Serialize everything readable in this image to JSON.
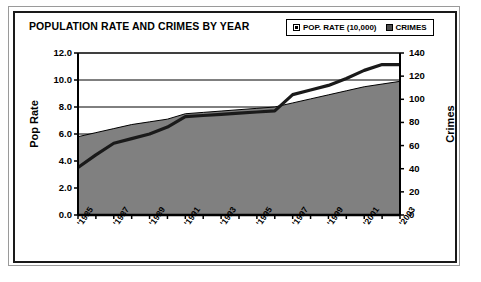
{
  "chart": {
    "title": "POPULATION RATE AND CRIMES BY YEAR",
    "legend": {
      "items": [
        {
          "label": "POP. RATE (10,000)",
          "swatch": "pop-rate-swatch",
          "color": "#ffffff"
        },
        {
          "label": "CRIMES",
          "swatch": "crimes-swatch",
          "color": "#4d4d4d"
        }
      ]
    },
    "axis_left_title": "Pop Rate",
    "axis_right_title": "Crimes",
    "area_fill_color": "#808080",
    "line_color": "#1a1a1a"
  },
  "chart_data": {
    "type": "area",
    "title": "POPULATION RATE AND CRIMES BY YEAR",
    "xlabel": "",
    "ylabel": "Pop Rate",
    "y2label": "Crimes",
    "grid": true,
    "legend_position": "top-right",
    "categories": [
      "'1985",
      "'1986",
      "'1987",
      "'1988",
      "'1989",
      "'1990",
      "'1991",
      "'1992",
      "'1993",
      "'1994",
      "'1995",
      "'1996",
      "'1997",
      "'1998",
      "'1999",
      "'2000",
      "'2001",
      "'2002",
      "'2003"
    ],
    "x_tick_labels": [
      "'1985",
      "'1987",
      "'1989",
      "'1991",
      "'1993",
      "'1995",
      "'1997",
      "'1999",
      "'2001",
      "'2003"
    ],
    "ylim": [
      0.0,
      12.0
    ],
    "y_ticks": [
      "0.0",
      "2.0",
      "4.0",
      "6.0",
      "8.0",
      "10.0",
      "12.0"
    ],
    "y2lim": [
      0,
      140
    ],
    "y2_ticks": [
      "0",
      "20",
      "40",
      "60",
      "80",
      "100",
      "120",
      "140"
    ],
    "series": [
      {
        "name": "POP. RATE (10,000)",
        "axis": "left",
        "render": "area",
        "color": "#808080",
        "values": [
          5.8,
          6.1,
          6.4,
          6.7,
          6.9,
          7.1,
          7.5,
          7.6,
          7.7,
          7.8,
          7.9,
          8.0,
          8.3,
          8.6,
          8.9,
          9.2,
          9.5,
          9.7,
          9.9
        ]
      },
      {
        "name": "CRIMES",
        "axis": "right",
        "render": "line",
        "color": "#1a1a1a",
        "values": [
          41,
          52,
          62,
          66,
          70,
          76,
          85,
          86,
          87,
          88,
          89,
          90,
          104,
          108,
          112,
          118,
          125,
          130,
          130
        ]
      }
    ]
  }
}
